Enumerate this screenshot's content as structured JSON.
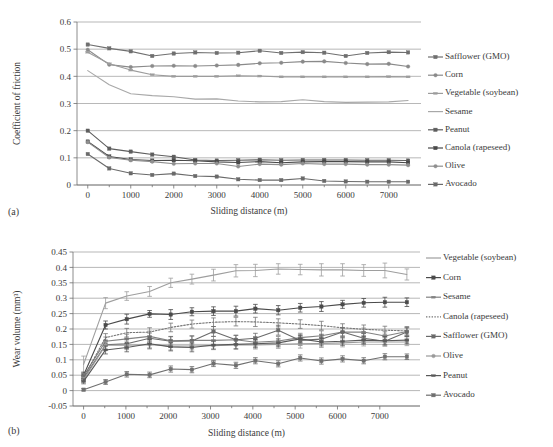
{
  "figure": {
    "panel_a_label": "(a)",
    "panel_b_label": "(b)"
  },
  "chart_data": [
    {
      "id": "a",
      "type": "line",
      "title": "",
      "xlabel": "Sliding distance (m)",
      "ylabel": "Coefficient of friction",
      "xlim": [
        -250,
        7750
      ],
      "ylim": [
        0,
        0.6
      ],
      "xticks": [
        0,
        1000,
        2000,
        3000,
        4000,
        5000,
        6000,
        7000
      ],
      "xtick_labels": [
        "0",
        "1000",
        "2000",
        "3000",
        "4000",
        "5000",
        "6000",
        "7000"
      ],
      "yticks": [
        0,
        0.1,
        0.2,
        0.3,
        0.4,
        0.5,
        0.6
      ],
      "ytick_labels": [
        "0",
        "0.1",
        "0.2",
        "0.3",
        "0.4",
        "0.5",
        "0.6"
      ],
      "grid": true,
      "legend_position": "right",
      "x": [
        0,
        500,
        1000,
        1500,
        2000,
        2500,
        3000,
        3500,
        4000,
        4500,
        5000,
        5500,
        6000,
        6500,
        7000,
        7450
      ],
      "series": [
        {
          "name": "Safflower (GMO)",
          "color": "#6f6f6f",
          "marker": "square",
          "dash": "none",
          "values": [
            0.517,
            0.503,
            0.492,
            0.475,
            0.484,
            0.488,
            0.486,
            0.487,
            0.494,
            0.486,
            0.489,
            0.487,
            0.475,
            0.486,
            0.489,
            0.488
          ]
        },
        {
          "name": "Corn",
          "color": "#8a8a8a",
          "marker": "circle",
          "dash": "none",
          "values": [
            0.498,
            0.443,
            0.434,
            0.438,
            0.439,
            0.438,
            0.44,
            0.442,
            0.448,
            0.45,
            0.454,
            0.455,
            0.449,
            0.445,
            0.446,
            0.436
          ]
        },
        {
          "name": "Vegetable (soybean)",
          "color": "#9c9c9c",
          "marker": "dash",
          "dash": "none",
          "values": [
            0.489,
            0.446,
            0.423,
            0.406,
            0.4,
            0.4,
            0.4,
            0.402,
            0.401,
            0.398,
            0.398,
            0.398,
            0.398,
            0.398,
            0.399,
            0.398
          ]
        },
        {
          "name": "Sesame",
          "color": "#a8a8a8",
          "marker": "none",
          "dash": "none",
          "values": [
            0.421,
            0.369,
            0.336,
            0.329,
            0.325,
            0.316,
            0.317,
            0.309,
            0.306,
            0.307,
            0.314,
            0.307,
            0.304,
            0.305,
            0.306,
            0.311
          ]
        },
        {
          "name": "Peanut",
          "color": "#5d5d5d",
          "marker": "square",
          "dash": "none",
          "values": [
            0.2,
            0.134,
            0.123,
            0.112,
            0.104,
            0.092,
            0.09,
            0.091,
            0.093,
            0.091,
            0.092,
            0.092,
            0.092,
            0.091,
            0.091,
            0.09
          ]
        },
        {
          "name": "Canola (rapeseed)",
          "color": "#4a4a4a",
          "marker": "square",
          "dash": "none",
          "values": [
            0.16,
            0.105,
            0.094,
            0.09,
            0.091,
            0.089,
            0.085,
            0.083,
            0.086,
            0.082,
            0.085,
            0.086,
            0.086,
            0.085,
            0.085,
            0.082
          ]
        },
        {
          "name": "Olive",
          "color": "#8f8f8f",
          "marker": "circle",
          "dash": "none",
          "values": [
            0.158,
            0.101,
            0.091,
            0.086,
            0.078,
            0.079,
            0.079,
            0.068,
            0.077,
            0.075,
            0.079,
            0.077,
            0.077,
            0.075,
            0.075,
            0.073
          ]
        },
        {
          "name": "Avocado",
          "color": "#6a6a6a",
          "marker": "square",
          "dash": "none",
          "values": [
            0.114,
            0.061,
            0.043,
            0.037,
            0.042,
            0.033,
            0.031,
            0.021,
            0.018,
            0.018,
            0.024,
            0.015,
            0.013,
            0.012,
            0.012,
            0.012
          ]
        }
      ]
    },
    {
      "id": "b",
      "type": "line",
      "title": "",
      "xlabel": "Sliding distance (m)",
      "ylabel": "Wear volume (mm³)",
      "xlim": [
        -250,
        7950
      ],
      "ylim": [
        -0.05,
        0.45
      ],
      "xticks": [
        0,
        1000,
        2000,
        3000,
        4000,
        5000,
        6000,
        7000
      ],
      "xtick_labels": [
        "0",
        "1000",
        "2000",
        "3000",
        "4000",
        "5000",
        "6000",
        "7000"
      ],
      "yticks": [
        -0.05,
        0,
        0.05,
        0.1,
        0.15,
        0.2,
        0.25,
        0.3,
        0.35,
        0.4,
        0.45
      ],
      "ytick_labels": [
        "-0.05",
        "0",
        "0.05",
        "0.1",
        "0.15",
        "0.2",
        "0.25",
        "0.3",
        "0.35",
        "0.4",
        "0.45"
      ],
      "grid": true,
      "legend_position": "right",
      "errorbars": true,
      "x": [
        0,
        520,
        1020,
        1560,
        2060,
        2560,
        3070,
        3600,
        4060,
        4600,
        5120,
        5620,
        6120,
        6620,
        7120,
        7640
      ],
      "series": [
        {
          "name": "Vegetable (soybean)",
          "color": "#9e9e9e",
          "marker": "none",
          "dash": "none",
          "values": [
            0.085,
            0.284,
            0.307,
            0.322,
            0.35,
            0.362,
            0.375,
            0.389,
            0.39,
            0.395,
            0.393,
            0.392,
            0.392,
            0.39,
            0.39,
            0.377
          ],
          "errors": [
            0.027,
            0.018,
            0.014,
            0.016,
            0.015,
            0.016,
            0.019,
            0.02,
            0.02,
            0.017,
            0.017,
            0.02,
            0.02,
            0.019,
            0.024,
            0.018
          ]
        },
        {
          "name": "Corn",
          "color": "#4a4a4a",
          "marker": "square",
          "dash": "none",
          "values": [
            0.05,
            0.213,
            0.232,
            0.249,
            0.247,
            0.256,
            0.258,
            0.258,
            0.266,
            0.261,
            0.269,
            0.273,
            0.28,
            0.285,
            0.287,
            0.287
          ],
          "errors": [
            0.01,
            0.013,
            0.016,
            0.011,
            0.016,
            0.013,
            0.014,
            0.016,
            0.014,
            0.015,
            0.014,
            0.016,
            0.013,
            0.014,
            0.016,
            0.014
          ]
        },
        {
          "name": "Sesame",
          "color": "#828282",
          "marker": "dash",
          "dash": "none",
          "values": [
            0.047,
            0.16,
            0.168,
            0.176,
            0.162,
            0.163,
            0.163,
            0.165,
            0.157,
            0.161,
            0.172,
            0.178,
            0.19,
            0.19,
            0.177,
            0.192
          ],
          "errors": [
            0.009,
            0.014,
            0.015,
            0.017,
            0.014,
            0.015,
            0.013,
            0.014,
            0.015,
            0.015,
            0.014,
            0.016,
            0.012,
            0.013,
            0.014,
            0.012
          ]
        },
        {
          "name": "Canola (rapeseed)",
          "color": "#767676",
          "marker": "none",
          "dash": "dotted",
          "values": [
            0.043,
            0.172,
            0.188,
            0.19,
            0.205,
            0.216,
            0.222,
            0.224,
            0.223,
            0.22,
            0.216,
            0.211,
            0.204,
            0.199,
            0.196,
            0.194
          ],
          "errors": [
            0.009,
            0.013,
            0.014,
            0.014,
            0.014,
            0.013,
            0.014,
            0.014,
            0.015,
            0.013,
            0.014,
            0.014,
            0.013,
            0.014,
            0.013,
            0.014
          ]
        },
        {
          "name": "Safflower (GMO)",
          "color": "#6a6a6a",
          "marker": "square",
          "dash": "none",
          "values": [
            0.04,
            0.149,
            0.152,
            0.17,
            0.16,
            0.161,
            0.192,
            0.165,
            0.17,
            0.196,
            0.163,
            0.167,
            0.19,
            0.17,
            0.16,
            0.19
          ],
          "errors": [
            0.009,
            0.015,
            0.016,
            0.017,
            0.015,
            0.016,
            0.016,
            0.015,
            0.016,
            0.016,
            0.016,
            0.016,
            0.015,
            0.016,
            0.015,
            0.014
          ]
        },
        {
          "name": "Olive",
          "color": "#9a9a9a",
          "marker": "circle",
          "dash": "none",
          "values": [
            0.035,
            0.147,
            0.147,
            0.149,
            0.145,
            0.145,
            0.146,
            0.148,
            0.148,
            0.15,
            0.152,
            0.153,
            0.155,
            0.158,
            0.158,
            0.158
          ],
          "errors": [
            0.008,
            0.013,
            0.014,
            0.014,
            0.013,
            0.013,
            0.013,
            0.014,
            0.013,
            0.013,
            0.014,
            0.013,
            0.013,
            0.013,
            0.013,
            0.012
          ]
        },
        {
          "name": "Peanut",
          "color": "#595959",
          "marker": "dash",
          "dash": "none",
          "values": [
            0.03,
            0.132,
            0.14,
            0.152,
            0.142,
            0.14,
            0.148,
            0.15,
            0.152,
            0.155,
            0.168,
            0.158,
            0.16,
            0.164,
            0.162,
            0.164
          ],
          "errors": [
            0.008,
            0.013,
            0.014,
            0.014,
            0.013,
            0.014,
            0.013,
            0.014,
            0.013,
            0.013,
            0.013,
            0.013,
            0.013,
            0.013,
            0.013,
            0.012
          ]
        },
        {
          "name": "Avocado",
          "color": "#6f6f6f",
          "marker": "square",
          "dash": "none",
          "values": [
            0.003,
            0.028,
            0.053,
            0.051,
            0.07,
            0.068,
            0.088,
            0.082,
            0.097,
            0.087,
            0.106,
            0.096,
            0.103,
            0.097,
            0.11,
            0.11
          ],
          "errors": [
            0.004,
            0.008,
            0.009,
            0.009,
            0.01,
            0.01,
            0.01,
            0.01,
            0.01,
            0.01,
            0.01,
            0.01,
            0.01,
            0.01,
            0.01,
            0.009
          ]
        }
      ]
    }
  ]
}
